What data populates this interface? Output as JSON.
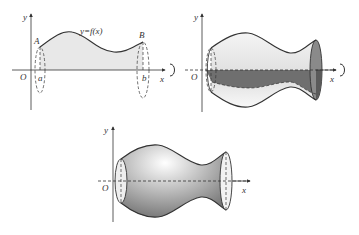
{
  "figures": [
    {
      "id": "fig1",
      "title": "Region under curve",
      "labels": {
        "y_axis": "y",
        "x_axis": "x",
        "origin": "O",
        "curve": "y=f(x)",
        "point_A": "A",
        "point_B": "B",
        "a": "a",
        "b": "b"
      }
    },
    {
      "id": "fig2",
      "title": "Partially revolved solid",
      "labels": {
        "y_axis": "y",
        "x_axis": "x",
        "origin": "O"
      }
    },
    {
      "id": "fig3",
      "title": "Solid of revolution",
      "labels": {
        "y_axis": "y",
        "x_axis": "x",
        "origin": "O"
      }
    }
  ],
  "colors": {
    "stroke": "#333333",
    "region_fill": "#e6e6e6",
    "dark_fill": "#6e6e6e",
    "light_fill": "#eeeeee"
  }
}
